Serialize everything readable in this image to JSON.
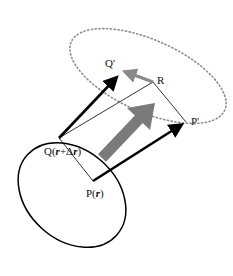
{
  "diagram": {
    "type": "vector-deformation",
    "labels": {
      "q_prime": "Q'",
      "r": "R",
      "p_prime": "P'",
      "q": "Q(",
      "q_r": "r",
      "q_plus": "+Δ",
      "q_r2": "r",
      "q_close": ")",
      "p": "P(",
      "p_r": "r",
      "p_close": ")"
    },
    "points": {
      "Q": [
        59,
        138
      ],
      "P": [
        93,
        181
      ],
      "Q_prime": [
        119,
        73
      ],
      "R": [
        153,
        82
      ],
      "P_prime": [
        186,
        122
      ]
    },
    "colors": {
      "stroke": "#000000",
      "arrow_grey": "#7a7a7a",
      "dotted": "#8c8c8c"
    }
  }
}
